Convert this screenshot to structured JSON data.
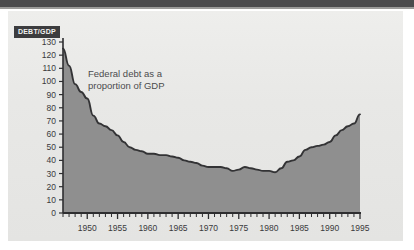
{
  "figure": {
    "background_color": "#e9e9e7",
    "page_color": "#ffffff",
    "top_band_color": "#4a4a4c"
  },
  "axis_title": {
    "text": "DEBT/GDP",
    "background_color": "#3c3c3e",
    "text_color": "#f2f2f0"
  },
  "annotation": {
    "text": "Federal debt as a\nproportion of GDP",
    "color": "#4b4b4d"
  },
  "chart_data": {
    "type": "area",
    "title": "",
    "subtitle": "",
    "annotations": [
      "Federal debt as a proportion of GDP"
    ],
    "xlabel": "",
    "ylabel": "DEBT/GDP",
    "xlim": [
      1946,
      1995
    ],
    "ylim": [
      0,
      130
    ],
    "grid": false,
    "legend": "none",
    "line_color": "#333335",
    "fill_color": "#8f8f8f",
    "y_ticks": [
      0,
      10,
      20,
      30,
      40,
      50,
      60,
      70,
      80,
      90,
      100,
      110,
      120,
      130
    ],
    "y_tick_labels": [
      "0",
      "10",
      "20",
      "30",
      "40",
      "50",
      "60",
      "70",
      "80",
      "90",
      "100",
      "110",
      "120",
      "130"
    ],
    "x_ticks": [
      1950,
      1955,
      1960,
      1965,
      1970,
      1975,
      1980,
      1985,
      1990,
      1995
    ],
    "x_tick_labels": [
      "1950",
      "1955",
      "1960",
      "1965",
      "1970",
      "1975",
      "1980",
      "1985",
      "1990",
      "1995"
    ],
    "x_minor_tick_interval": 1,
    "x": [
      1946,
      1947,
      1948,
      1949,
      1950,
      1951,
      1952,
      1953,
      1954,
      1955,
      1956,
      1957,
      1958,
      1959,
      1960,
      1961,
      1962,
      1963,
      1964,
      1965,
      1966,
      1967,
      1968,
      1969,
      1970,
      1971,
      1972,
      1973,
      1974,
      1975,
      1976,
      1977,
      1978,
      1979,
      1980,
      1981,
      1982,
      1983,
      1984,
      1985,
      1986,
      1987,
      1988,
      1989,
      1990,
      1991,
      1992,
      1993,
      1994,
      1995
    ],
    "values": [
      125,
      112,
      98,
      92,
      87,
      74,
      68,
      66,
      63,
      59,
      54,
      50,
      48,
      47,
      45,
      45,
      44,
      44,
      43,
      42,
      40,
      39,
      38,
      36,
      35,
      35,
      35,
      34,
      32,
      33,
      35,
      34,
      33,
      32,
      32,
      31,
      34,
      39,
      40,
      43,
      48,
      50,
      51,
      52,
      54,
      59,
      63,
      66,
      68,
      75
    ],
    "series": [
      {
        "name": "Federal debt as a proportion of GDP",
        "values": [
          125,
          112,
          98,
          92,
          87,
          74,
          68,
          66,
          63,
          59,
          54,
          50,
          48,
          47,
          45,
          45,
          44,
          44,
          43,
          42,
          40,
          39,
          38,
          36,
          35,
          35,
          35,
          34,
          32,
          33,
          35,
          34,
          33,
          32,
          32,
          31,
          34,
          39,
          40,
          43,
          48,
          50,
          51,
          52,
          54,
          59,
          63,
          66,
          68,
          75
        ]
      }
    ]
  },
  "geometry": {
    "plot_left": 63,
    "plot_right": 360,
    "plot_top": 42,
    "plot_bottom": 213
  }
}
